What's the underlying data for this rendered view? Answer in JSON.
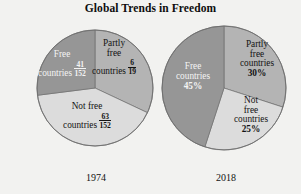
{
  "title": "Global Trends in Freedom",
  "palette": {
    "free": "#969696",
    "partly_free": "#b4b4b4",
    "not_free": "#dcdcdc",
    "outline": "#6e6e6e",
    "background": "#f2f2f0",
    "text": "#131313",
    "text_on_dark": "#f4f4f4"
  },
  "charts": [
    {
      "id": "pie-1974",
      "year": "1974",
      "slices": [
        {
          "key": "free",
          "name": "Free countries",
          "line1": "Free",
          "line2": "countries",
          "numerator": "41",
          "denominator": "152",
          "value_text": "41/152",
          "percent": 27,
          "color": "#969696",
          "label_on_dark": true
        },
        {
          "key": "partly_free",
          "name": "Partly free countries",
          "line1": "Partly",
          "line2": "free",
          "line3": "countries",
          "numerator": "6",
          "denominator": "19",
          "value_text": "6/19",
          "percent": 32,
          "color": "#b4b4b4",
          "label_on_dark": false
        },
        {
          "key": "not_free",
          "name": "Not free countries",
          "line1": "Not free",
          "line2": "countries",
          "numerator": "63",
          "denominator": "152",
          "value_text": "63/152",
          "percent": 41,
          "color": "#dcdcdc",
          "label_on_dark": false
        }
      ]
    },
    {
      "id": "pie-2018",
      "year": "2018",
      "slices": [
        {
          "key": "free",
          "name": "Free countries",
          "line1": "Free",
          "line2": "countries",
          "value_text": "45%",
          "percent": 45,
          "color": "#969696",
          "label_on_dark": true
        },
        {
          "key": "partly_free",
          "name": "Partly free countries",
          "line1": "Partly",
          "line2": "free",
          "line3": "countries",
          "value_text": "30%",
          "percent": 30,
          "color": "#b4b4b4",
          "label_on_dark": false
        },
        {
          "key": "not_free",
          "name": "Not free countries",
          "line1": "Not",
          "line2": "free",
          "line3": "countries",
          "value_text": "25%",
          "percent": 25,
          "color": "#dcdcdc",
          "label_on_dark": false
        }
      ]
    }
  ],
  "chart_data": {
    "type": "pie",
    "title": "Global Trends in Freedom",
    "xlabel": "",
    "ylabel": "",
    "legend": "none",
    "grid": false,
    "panels": [
      {
        "label": "1974",
        "categories": [
          "Free countries",
          "Partly free countries",
          "Not free countries"
        ],
        "values": [
          27,
          32,
          41
        ],
        "value_labels": [
          "41/152",
          "6/19",
          "63/152"
        ],
        "units": "fraction of countries"
      },
      {
        "label": "2018",
        "categories": [
          "Free countries",
          "Partly free countries",
          "Not free countries"
        ],
        "values": [
          45,
          30,
          25
        ],
        "value_labels": [
          "45%",
          "30%",
          "25%"
        ],
        "units": "percent"
      }
    ]
  }
}
